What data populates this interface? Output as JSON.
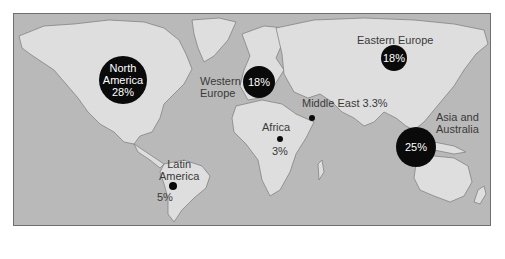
{
  "map": {
    "colors": {
      "ocean": "#b9b9b9",
      "land": "#dedede",
      "border": "#6f6f6f",
      "marker": "#0a0a0a",
      "label_text": "#3a3a3a",
      "bubble_text": "#ffffff"
    },
    "regions": [
      {
        "id": "north-america",
        "name_line1": "North",
        "name_line2": "America",
        "value": "28%",
        "marker": "bubble"
      },
      {
        "id": "western-europe",
        "name_line1": "Western",
        "name_line2": "Europe",
        "value": "18%",
        "marker": "bubble"
      },
      {
        "id": "eastern-europe",
        "name": "Eastern Europe",
        "value": "18%",
        "marker": "bubble"
      },
      {
        "id": "middle-east",
        "name": "Middle East 3.3%",
        "value": "3.3%",
        "marker": "dot"
      },
      {
        "id": "africa",
        "name": "Africa",
        "value": "3%",
        "marker": "dot"
      },
      {
        "id": "asia-australia",
        "name_line1": "Asia and",
        "name_line2": "Australia",
        "value": "25%",
        "marker": "bubble"
      },
      {
        "id": "latin-america",
        "name_line1": "Latin",
        "name_line2": "America",
        "value": "5%",
        "marker": "dot"
      }
    ]
  }
}
